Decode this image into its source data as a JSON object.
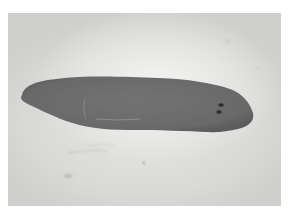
{
  "caption": {
    "text": "",
    "note": ""
  },
  "figure": {
    "style": "grayscale light micrograph",
    "colors": {
      "background": "#e2e2e0",
      "body": "#6e6e6e",
      "body_dark_edge": "#5e5e5e",
      "eyespot": "#2e2e2e",
      "pharynx_line": "#a8a8a8"
    }
  }
}
